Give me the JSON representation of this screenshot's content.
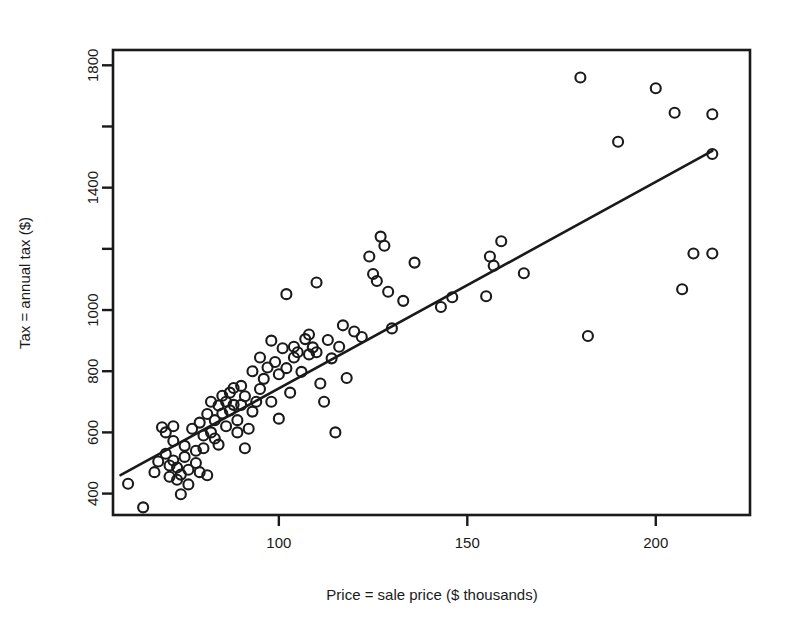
{
  "chart_data": {
    "type": "scatter",
    "title": "",
    "xlabel": "Price = sale price ($ thousands)",
    "ylabel": "Tax = annual tax ($)",
    "xlim": [
      56,
      225
    ],
    "ylim": [
      330,
      1850
    ],
    "xticks": [
      100,
      150,
      200
    ],
    "xtick_labels": [
      "100",
      "150",
      "200"
    ],
    "yticks": [
      400,
      600,
      800,
      1000,
      1400,
      1800
    ],
    "ytick_labels": [
      "400",
      "600",
      "800",
      "1000",
      "1400",
      "1800"
    ],
    "yticks_minor": [
      1200,
      1600
    ],
    "grid": false,
    "legend": null,
    "marker": "open-circle",
    "marker_color": "#1a1a1a",
    "fit_line": {
      "label": "least-squares regression line",
      "color": "#1a1a1a",
      "x_start": 58,
      "y_start": 460,
      "x_end": 215,
      "y_end": 1520
    },
    "points": [
      [
        60,
        432
      ],
      [
        64,
        355
      ],
      [
        67,
        470
      ],
      [
        68,
        505
      ],
      [
        69,
        617
      ],
      [
        70,
        600
      ],
      [
        70,
        530
      ],
      [
        71,
        492
      ],
      [
        71,
        455
      ],
      [
        72,
        620
      ],
      [
        72,
        572
      ],
      [
        72,
        508
      ],
      [
        73,
        485
      ],
      [
        73,
        445
      ],
      [
        74,
        398
      ],
      [
        74,
        462
      ],
      [
        75,
        556
      ],
      [
        75,
        520
      ],
      [
        76,
        478
      ],
      [
        76,
        430
      ],
      [
        77,
        612
      ],
      [
        78,
        540
      ],
      [
        78,
        500
      ],
      [
        79,
        470
      ],
      [
        79,
        632
      ],
      [
        80,
        590
      ],
      [
        80,
        548
      ],
      [
        81,
        660
      ],
      [
        81,
        460
      ],
      [
        82,
        600
      ],
      [
        82,
        700
      ],
      [
        83,
        640
      ],
      [
        83,
        580
      ],
      [
        84,
        688
      ],
      [
        84,
        560
      ],
      [
        85,
        720
      ],
      [
        85,
        662
      ],
      [
        86,
        700
      ],
      [
        86,
        620
      ],
      [
        87,
        730
      ],
      [
        87,
        672
      ],
      [
        88,
        690
      ],
      [
        88,
        745
      ],
      [
        89,
        640
      ],
      [
        89,
        600
      ],
      [
        90,
        752
      ],
      [
        90,
        690
      ],
      [
        91,
        548
      ],
      [
        91,
        718
      ],
      [
        92,
        612
      ],
      [
        93,
        800
      ],
      [
        93,
        668
      ],
      [
        94,
        700
      ],
      [
        95,
        845
      ],
      [
        95,
        742
      ],
      [
        96,
        775
      ],
      [
        97,
        812
      ],
      [
        98,
        700
      ],
      [
        98,
        900
      ],
      [
        99,
        830
      ],
      [
        100,
        790
      ],
      [
        100,
        645
      ],
      [
        101,
        875
      ],
      [
        102,
        1052
      ],
      [
        102,
        810
      ],
      [
        103,
        730
      ],
      [
        104,
        880
      ],
      [
        104,
        845
      ],
      [
        105,
        862
      ],
      [
        106,
        798
      ],
      [
        107,
        905
      ],
      [
        108,
        855
      ],
      [
        108,
        920
      ],
      [
        109,
        878
      ],
      [
        110,
        862
      ],
      [
        110,
        1090
      ],
      [
        111,
        760
      ],
      [
        112,
        700
      ],
      [
        113,
        902
      ],
      [
        114,
        842
      ],
      [
        115,
        600
      ],
      [
        116,
        880
      ],
      [
        117,
        950
      ],
      [
        118,
        778
      ],
      [
        120,
        930
      ],
      [
        122,
        912
      ],
      [
        124,
        1175
      ],
      [
        125,
        1118
      ],
      [
        126,
        1095
      ],
      [
        127,
        1240
      ],
      [
        128,
        1210
      ],
      [
        129,
        1060
      ],
      [
        130,
        940
      ],
      [
        133,
        1030
      ],
      [
        136,
        1155
      ],
      [
        143,
        1010
      ],
      [
        146,
        1042
      ],
      [
        155,
        1045
      ],
      [
        156,
        1175
      ],
      [
        157,
        1145
      ],
      [
        159,
        1225
      ],
      [
        165,
        1120
      ],
      [
        180,
        1760
      ],
      [
        182,
        915
      ],
      [
        190,
        1550
      ],
      [
        200,
        1725
      ],
      [
        205,
        1645
      ],
      [
        207,
        1068
      ],
      [
        210,
        1185
      ],
      [
        215,
        1640
      ],
      [
        215,
        1185
      ],
      [
        215,
        1510
      ]
    ]
  }
}
